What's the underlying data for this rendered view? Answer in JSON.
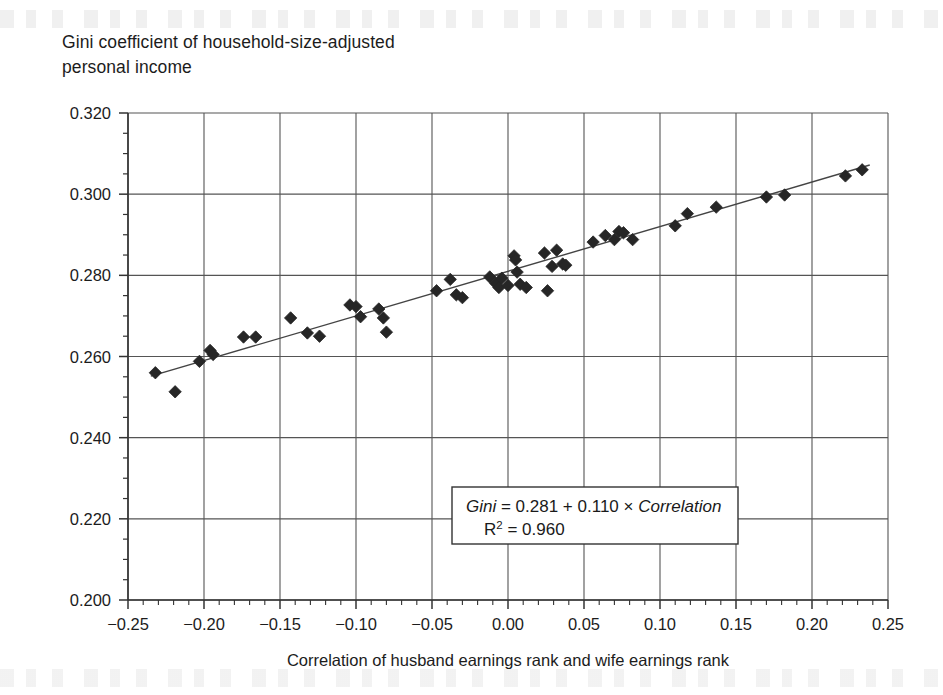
{
  "figure": {
    "background_color": "#ffffff",
    "axis_color": "#333333",
    "grid_color": "#555555",
    "marker_color": "#262626",
    "trend_color": "#444444"
  },
  "chart_data": {
    "type": "scatter",
    "title": "",
    "ylabel": "Gini coefficient of household-size-adjusted\npersonal income",
    "xlabel": "Correlation of husband earnings rank and wife earnings rank",
    "xlim": [
      -0.25,
      0.25
    ],
    "ylim": [
      0.2,
      0.32
    ],
    "xticks": [
      -0.25,
      -0.2,
      -0.15,
      -0.1,
      -0.05,
      0.0,
      0.05,
      0.1,
      0.15,
      0.2,
      0.25
    ],
    "xtick_labels": [
      "−0.25",
      "−0.20",
      "−0.15",
      "−0.10",
      "−0.05",
      "0.00",
      "0.05",
      "0.10",
      "0.15",
      "0.20",
      "0.25"
    ],
    "yticks": [
      0.2,
      0.22,
      0.24,
      0.26,
      0.28,
      0.3,
      0.32
    ],
    "ytick_labels": [
      "0.200",
      "0.220",
      "0.240",
      "0.260",
      "0.280",
      "0.300",
      "0.320"
    ],
    "x_minor_tick_step": 0.01,
    "y_minor_tick_step": 0.005,
    "grid": true,
    "legend": false,
    "marker": "diamond",
    "points": [
      {
        "x": -0.232,
        "y": 0.256
      },
      {
        "x": -0.219,
        "y": 0.2513
      },
      {
        "x": -0.203,
        "y": 0.2588
      },
      {
        "x": -0.196,
        "y": 0.2615
      },
      {
        "x": -0.194,
        "y": 0.2605
      },
      {
        "x": -0.174,
        "y": 0.2648
      },
      {
        "x": -0.166,
        "y": 0.2648
      },
      {
        "x": -0.143,
        "y": 0.2695
      },
      {
        "x": -0.132,
        "y": 0.2658
      },
      {
        "x": -0.124,
        "y": 0.265
      },
      {
        "x": -0.104,
        "y": 0.2727
      },
      {
        "x": -0.1,
        "y": 0.2723
      },
      {
        "x": -0.097,
        "y": 0.2698
      },
      {
        "x": -0.085,
        "y": 0.2717
      },
      {
        "x": -0.082,
        "y": 0.2695
      },
      {
        "x": -0.08,
        "y": 0.266
      },
      {
        "x": -0.047,
        "y": 0.2762
      },
      {
        "x": -0.038,
        "y": 0.279
      },
      {
        "x": -0.034,
        "y": 0.2752
      },
      {
        "x": -0.03,
        "y": 0.2745
      },
      {
        "x": -0.012,
        "y": 0.2796
      },
      {
        "x": -0.008,
        "y": 0.278
      },
      {
        "x": -0.006,
        "y": 0.277
      },
      {
        "x": -0.004,
        "y": 0.2793
      },
      {
        "x": 0.0,
        "y": 0.2775
      },
      {
        "x": 0.004,
        "y": 0.2848
      },
      {
        "x": 0.005,
        "y": 0.2838
      },
      {
        "x": 0.006,
        "y": 0.2808
      },
      {
        "x": 0.008,
        "y": 0.2778
      },
      {
        "x": 0.012,
        "y": 0.277
      },
      {
        "x": 0.024,
        "y": 0.2855
      },
      {
        "x": 0.026,
        "y": 0.2762
      },
      {
        "x": 0.029,
        "y": 0.2822
      },
      {
        "x": 0.032,
        "y": 0.2862
      },
      {
        "x": 0.036,
        "y": 0.2828
      },
      {
        "x": 0.038,
        "y": 0.2825
      },
      {
        "x": 0.056,
        "y": 0.2882
      },
      {
        "x": 0.064,
        "y": 0.2898
      },
      {
        "x": 0.07,
        "y": 0.2888
      },
      {
        "x": 0.073,
        "y": 0.2908
      },
      {
        "x": 0.076,
        "y": 0.2905
      },
      {
        "x": 0.082,
        "y": 0.2888
      },
      {
        "x": 0.11,
        "y": 0.2922
      },
      {
        "x": 0.118,
        "y": 0.2952
      },
      {
        "x": 0.137,
        "y": 0.2968
      },
      {
        "x": 0.17,
        "y": 0.2993
      },
      {
        "x": 0.182,
        "y": 0.2998
      },
      {
        "x": 0.222,
        "y": 0.3045
      },
      {
        "x": 0.233,
        "y": 0.306
      }
    ],
    "trendline": {
      "intercept": 0.281,
      "slope": 0.11,
      "x_start": -0.235,
      "x_end": 0.238
    },
    "annotation": {
      "equation_prefix": "Gini",
      "equation_body": " = 0.281 + 0.110 × ",
      "equation_var": "Correlation",
      "r_squared_label": "R",
      "r_squared_exp": "2",
      "r_squared_value": " = 0.960",
      "box_border_color": "#333333"
    }
  }
}
